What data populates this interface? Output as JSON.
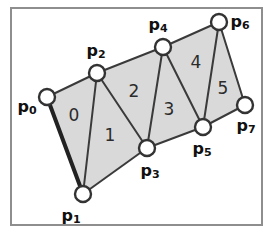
{
  "figure": {
    "canvas": {
      "width": 273,
      "height": 238
    },
    "frame": {
      "x": 11,
      "y": 8,
      "width": 251,
      "height": 217,
      "color": "#8e8e8e"
    },
    "colors": {
      "face_fill": "#d9d9d9",
      "edge": "#3a3a3a",
      "bold_edge": "#222222",
      "vertex_fill": "#ffffff",
      "vertex_stroke": "#333333",
      "background": "#ffffff",
      "label_text": "#111111"
    }
  },
  "vertices": [
    {
      "id": "p0",
      "name": "p",
      "subscript": "0",
      "x": 47,
      "y": 97,
      "label_x": 27,
      "label_y": 107
    },
    {
      "id": "p1",
      "name": "p",
      "subscript": "1",
      "x": 83,
      "y": 194,
      "label_x": 71,
      "label_y": 216
    },
    {
      "id": "p2",
      "name": "p",
      "subscript": "2",
      "x": 97,
      "y": 73,
      "label_x": 96,
      "label_y": 51
    },
    {
      "id": "p3",
      "name": "p",
      "subscript": "3",
      "x": 147,
      "y": 148,
      "label_x": 150,
      "label_y": 171
    },
    {
      "id": "p4",
      "name": "p",
      "subscript": "4",
      "x": 163,
      "y": 47,
      "label_x": 158,
      "label_y": 25
    },
    {
      "id": "p5",
      "name": "p",
      "subscript": "5",
      "x": 203,
      "y": 127,
      "label_x": 202,
      "label_y": 149
    },
    {
      "id": "p6",
      "name": "p",
      "subscript": "6",
      "x": 219,
      "y": 22,
      "label_x": 240,
      "label_y": 22
    },
    {
      "id": "p7",
      "name": "p",
      "subscript": "7",
      "x": 245,
      "y": 105,
      "label_x": 246,
      "label_y": 126
    }
  ],
  "triangles": [
    {
      "index": "0",
      "vertices": [
        "p0",
        "p1",
        "p2"
      ],
      "label_x": 74,
      "label_y": 116
    },
    {
      "index": "1",
      "vertices": [
        "p1",
        "p2",
        "p3"
      ],
      "label_x": 110,
      "label_y": 136
    },
    {
      "index": "2",
      "vertices": [
        "p2",
        "p3",
        "p4"
      ],
      "label_x": 134,
      "label_y": 92
    },
    {
      "index": "3",
      "vertices": [
        "p3",
        "p4",
        "p5"
      ],
      "label_x": 169,
      "label_y": 110
    },
    {
      "index": "4",
      "vertices": [
        "p4",
        "p5",
        "p6"
      ],
      "label_x": 196,
      "label_y": 63
    },
    {
      "index": "5",
      "vertices": [
        "p5",
        "p6",
        "p7"
      ],
      "label_x": 223,
      "label_y": 89
    }
  ],
  "edges": [
    {
      "from": "p0",
      "to": "p1",
      "bold": true
    },
    {
      "from": "p0",
      "to": "p2",
      "bold": false
    },
    {
      "from": "p1",
      "to": "p2",
      "bold": false
    },
    {
      "from": "p1",
      "to": "p3",
      "bold": false
    },
    {
      "from": "p2",
      "to": "p3",
      "bold": false
    },
    {
      "from": "p2",
      "to": "p4",
      "bold": false
    },
    {
      "from": "p3",
      "to": "p4",
      "bold": false
    },
    {
      "from": "p3",
      "to": "p5",
      "bold": false
    },
    {
      "from": "p4",
      "to": "p5",
      "bold": false
    },
    {
      "from": "p4",
      "to": "p6",
      "bold": false
    },
    {
      "from": "p5",
      "to": "p6",
      "bold": false
    },
    {
      "from": "p5",
      "to": "p7",
      "bold": false
    },
    {
      "from": "p6",
      "to": "p7",
      "bold": false
    }
  ],
  "vertex_radius": 8
}
